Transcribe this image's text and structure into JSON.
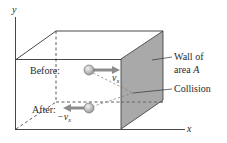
{
  "diagram": {
    "axes": {
      "x_label": "x",
      "y_label": "y"
    },
    "labels": {
      "before": "Before:",
      "after": "After:",
      "v_before": "v",
      "v_before_sub": "x",
      "v_after_prefix": "−v",
      "v_after_sub": "x",
      "wall_line1": "Wall of",
      "wall_line2_text": "area ",
      "wall_line2_var": "A",
      "collision": "Collision"
    },
    "colors": {
      "line": "#333333",
      "wall_fill": "#a9a9a9",
      "arrow": "#8c8c8c",
      "ball": "#c8c8c8",
      "dashed_path": "#7a7a7a"
    }
  }
}
